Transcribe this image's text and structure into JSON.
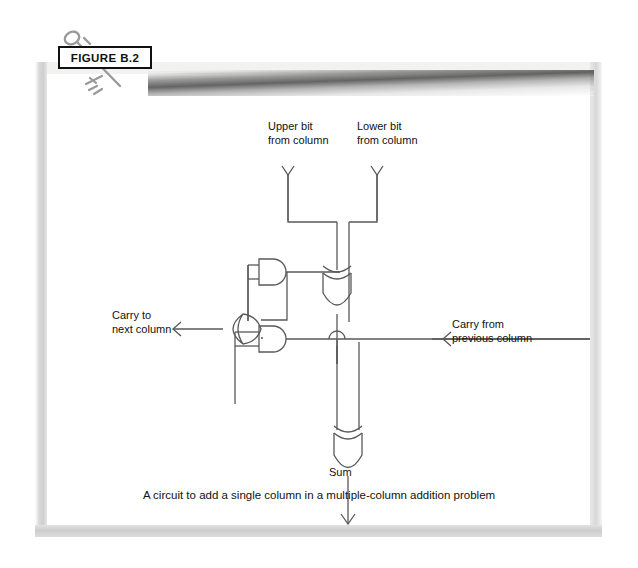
{
  "figure": {
    "label": "FIGURE B.2",
    "caption": "A circuit to add a single column in a multiple-column addition problem"
  },
  "diagram": {
    "type": "logic-circuit",
    "labels": {
      "upper_bit": "Upper bit\nfrom column",
      "lower_bit": "Lower bit\nfrom column",
      "carry_to": "Carry to\nnext column",
      "carry_from": "Carry from\nprevious column",
      "sum": "Sum"
    },
    "gates": [
      {
        "name": "and-gate-top",
        "kind": "AND",
        "orientation": "right"
      },
      {
        "name": "and-gate-bottom",
        "kind": "AND",
        "orientation": "right"
      },
      {
        "name": "or-gate",
        "kind": "OR",
        "orientation": "left"
      },
      {
        "name": "xor-gate-upper",
        "kind": "XOR",
        "orientation": "down"
      },
      {
        "name": "xor-gate-lower",
        "kind": "XOR",
        "orientation": "down"
      }
    ]
  },
  "colors": {
    "ink": "#222222",
    "wire": "#555555",
    "page": "#ffffff",
    "frame": "#d4d4d4",
    "label_border": "#111111"
  }
}
